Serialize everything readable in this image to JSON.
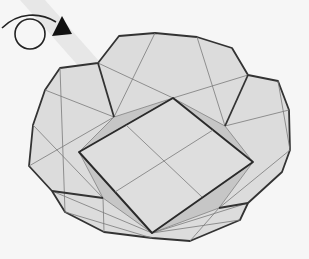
{
  "diagram": {
    "colors": {
      "background": "#f6f6f6",
      "paper": "#dcdcdc",
      "paper_shade": "#c8c8c8",
      "outline": "#333333",
      "crease": "#7a7a7a",
      "arrow": "#222222",
      "stripe": "#e6e6e6"
    },
    "symbol": {
      "name": "turn-over",
      "description": "Loop arrow indicating the model is turned over"
    },
    "outline_points": "98,63 119,36 155,33 197,37 232,48 248,75 278,81 289,110 290,150 282,172 248,203 240,220 190,241 152,238 104,232 65,212 52,191 29,166 33,125 45,90 60,68",
    "inner_square": {
      "top": [
        173,
        98
      ],
      "right": [
        253,
        162
      ],
      "bottom": [
        152,
        233
      ],
      "left": [
        79,
        152
      ]
    }
  }
}
